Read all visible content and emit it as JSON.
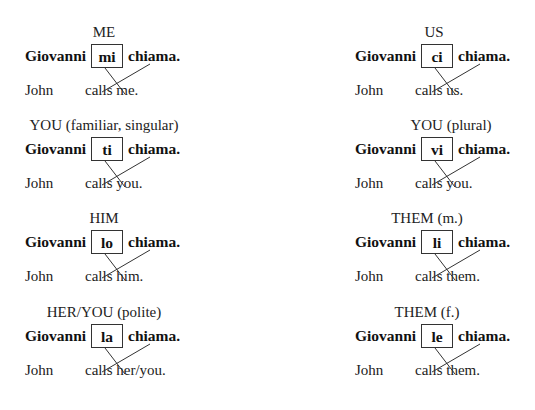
{
  "columns": [
    {
      "x": 25,
      "items": [
        {
          "header": "ME",
          "subject": "Giovanni",
          "pronoun": "mi",
          "verb": "chiama.",
          "en_subject": "John",
          "en_verb_phrase": "calls me."
        },
        {
          "header": "YOU (familiar, singular)",
          "subject": "Giovanni",
          "pronoun": "ti",
          "verb": "chiama.",
          "en_subject": "John",
          "en_verb_phrase": "calls you."
        },
        {
          "header": "HIM",
          "subject": "Giovanni",
          "pronoun": "lo",
          "verb": "chiama.",
          "en_subject": "John",
          "en_verb_phrase": "calls him."
        },
        {
          "header": "HER/YOU (polite)",
          "subject": "Giovanni",
          "pronoun": "la",
          "verb": "chiama.",
          "en_subject": "John",
          "en_verb_phrase": "calls her/you."
        }
      ]
    },
    {
      "x": 355,
      "items": [
        {
          "header": "US",
          "subject": "Giovanni",
          "pronoun": "ci",
          "verb": "chiama.",
          "en_subject": "John",
          "en_verb_phrase": "calls us."
        },
        {
          "header": "YOU (plural)",
          "subject": "Giovanni",
          "pronoun": "vi",
          "verb": "chiama.",
          "en_subject": "John",
          "en_verb_phrase": "calls you."
        },
        {
          "header": "THEM (m.)",
          "subject": "Giovanni",
          "pronoun": "li",
          "verb": "chiama.",
          "en_subject": "John",
          "en_verb_phrase": "calls them."
        },
        {
          "header": "THEM (f.)",
          "subject": "Giovanni",
          "pronoun": "le",
          "verb": "chiama.",
          "en_subject": "John",
          "en_verb_phrase": "calls them."
        }
      ]
    }
  ],
  "layout": {
    "row_tops": [
      24,
      117,
      210,
      304
    ],
    "header_center_offset": 79,
    "right_header_center_offsets": [
      79,
      96,
      72,
      72
    ],
    "left_header_center_offsets": [
      79,
      79,
      79,
      79
    ]
  },
  "colors": {
    "text": "#1a1a1a",
    "box_border": "#333333",
    "line": "#333333"
  }
}
